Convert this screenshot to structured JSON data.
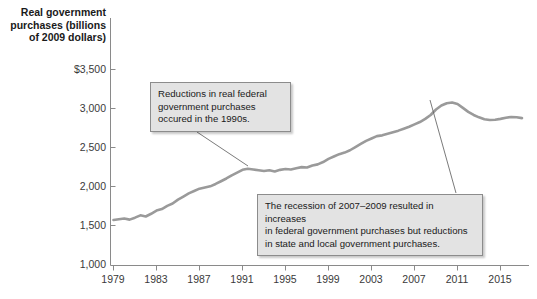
{
  "chart_data": {
    "type": "line",
    "title": "",
    "xlabel": "",
    "ylabel": "Real government purchases (billions of 2009 dollars)",
    "xlim": [
      1979,
      2017
    ],
    "ylim": [
      1000,
      3500
    ],
    "grid": false,
    "legend": "none",
    "x_ticks": [
      "1979",
      "1983",
      "1987",
      "1991",
      "1995",
      "1999",
      "2003",
      "2007",
      "2011",
      "2015"
    ],
    "x_tick_values": [
      1979,
      1983,
      1987,
      1991,
      1995,
      1999,
      2003,
      2007,
      2011,
      2015
    ],
    "y_ticks": [
      "1,000",
      "1,500",
      "2,000",
      "2,500",
      "3,000",
      "$3,500"
    ],
    "y_tick_values": [
      1000,
      1500,
      2000,
      2500,
      3000,
      3500
    ],
    "series": [
      {
        "name": "Real government purchases",
        "color": "#9a9a9a",
        "x": [
          1979,
          1979.5,
          1980,
          1980.5,
          1981,
          1981.5,
          1982,
          1982.5,
          1983,
          1983.5,
          1984,
          1984.5,
          1985,
          1985.5,
          1986,
          1986.5,
          1987,
          1987.5,
          1988,
          1988.5,
          1989,
          1989.5,
          1990,
          1990.5,
          1991,
          1991.5,
          1992,
          1992.5,
          1993,
          1993.5,
          1994,
          1994.5,
          1995,
          1995.5,
          1996,
          1996.5,
          1997,
          1997.5,
          1998,
          1998.5,
          1999,
          1999.5,
          2000,
          2000.5,
          2001,
          2001.5,
          2002,
          2002.5,
          2003,
          2003.5,
          2004,
          2004.5,
          2005,
          2005.5,
          2006,
          2006.5,
          2007,
          2007.5,
          2008,
          2008.5,
          2009,
          2009.5,
          2010,
          2010.5,
          2011,
          2011.5,
          2012,
          2012.5,
          2013,
          2013.5,
          2014,
          2014.5,
          2015,
          2015.5,
          2016,
          2016.5,
          2017
        ],
        "y": [
          1580,
          1590,
          1600,
          1585,
          1610,
          1640,
          1625,
          1660,
          1700,
          1720,
          1760,
          1790,
          1840,
          1880,
          1920,
          1950,
          1980,
          1995,
          2010,
          2040,
          2075,
          2110,
          2150,
          2185,
          2220,
          2235,
          2225,
          2215,
          2205,
          2215,
          2200,
          2220,
          2230,
          2225,
          2240,
          2255,
          2250,
          2275,
          2290,
          2320,
          2360,
          2390,
          2420,
          2440,
          2470,
          2510,
          2550,
          2590,
          2620,
          2650,
          2660,
          2680,
          2700,
          2720,
          2745,
          2770,
          2800,
          2830,
          2870,
          2920,
          2990,
          3040,
          3070,
          3080,
          3060,
          3010,
          2960,
          2920,
          2890,
          2865,
          2855,
          2860,
          2870,
          2885,
          2895,
          2890,
          2880
        ]
      }
    ],
    "annotations": [
      {
        "id": "callout-1990s",
        "text": "Reductions in real federal\ngovernment purchases\noccured in the 1990s.",
        "points_to_year": 1995.5,
        "points_to_value": 2228
      },
      {
        "id": "callout-recession",
        "text": "The recession of 2007–2009 resulted in increases\nin federal government purchases but reductions\nin state and local government purchases.",
        "points_to_year": 2009.6,
        "points_to_value": 3055
      }
    ]
  },
  "axis": {
    "title": "Real government\npurchases (billions\nof 2009 dollars)"
  },
  "colors": {
    "line": "#9a9a9a",
    "axis": "#8a8a8a",
    "callout_fill": "#e3e3e3",
    "callout_border": "#8c8c8c",
    "text": "#1a1a1a"
  }
}
